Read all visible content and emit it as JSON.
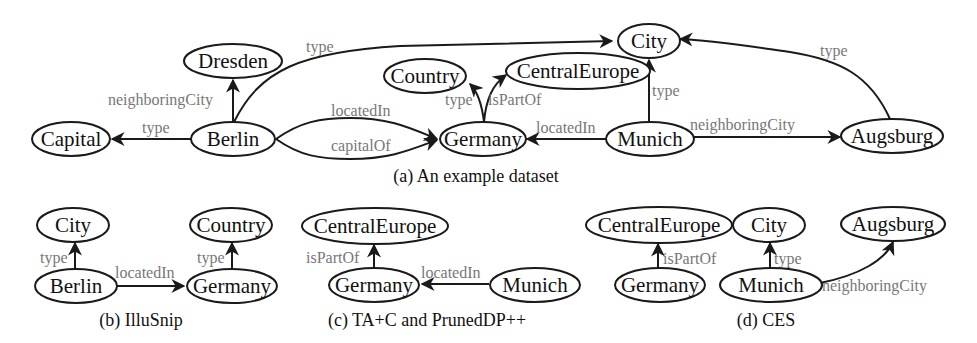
{
  "figure": {
    "panels": [
      {
        "id": "a",
        "caption": "(a) An example dataset",
        "nodes": [
          {
            "id": "Dresden",
            "label": "Dresden"
          },
          {
            "id": "Capital",
            "label": "Capital"
          },
          {
            "id": "Berlin",
            "label": "Berlin"
          },
          {
            "id": "Country",
            "label": "Country"
          },
          {
            "id": "CentralEurope",
            "label": "CentralEurope"
          },
          {
            "id": "City",
            "label": "City"
          },
          {
            "id": "Germany",
            "label": "Germany"
          },
          {
            "id": "Munich",
            "label": "Munich"
          },
          {
            "id": "Augsburg",
            "label": "Augsburg"
          }
        ],
        "edges": [
          {
            "from": "Berlin",
            "to": "Dresden",
            "label": "neighboringCity"
          },
          {
            "from": "Berlin",
            "to": "City",
            "label": "type"
          },
          {
            "from": "Berlin",
            "to": "Capital",
            "label": "type"
          },
          {
            "from": "Berlin",
            "to": "Germany",
            "label": "locatedIn"
          },
          {
            "from": "Berlin",
            "to": "Germany",
            "label": "capitalOf"
          },
          {
            "from": "Germany",
            "to": "Country",
            "label": "type"
          },
          {
            "from": "Germany",
            "to": "CentralEurope",
            "label": "isPartOf"
          },
          {
            "from": "Munich",
            "to": "City",
            "label": "type"
          },
          {
            "from": "Munich",
            "to": "Germany",
            "label": "locatedIn"
          },
          {
            "from": "Munich",
            "to": "Augsburg",
            "label": "neighboringCity"
          },
          {
            "from": "Augsburg",
            "to": "City",
            "label": "type"
          }
        ]
      },
      {
        "id": "b",
        "caption": "(b) IlluSnip",
        "nodes": [
          {
            "id": "City",
            "label": "City"
          },
          {
            "id": "Berlin",
            "label": "Berlin"
          },
          {
            "id": "Country",
            "label": "Country"
          },
          {
            "id": "Germany",
            "label": "Germany"
          }
        ],
        "edges": [
          {
            "from": "Berlin",
            "to": "City",
            "label": "type"
          },
          {
            "from": "Berlin",
            "to": "Germany",
            "label": "locatedIn"
          },
          {
            "from": "Germany",
            "to": "Country",
            "label": "type"
          }
        ]
      },
      {
        "id": "c",
        "caption": "(c) TA+C and PrunedDP++",
        "nodes": [
          {
            "id": "CentralEurope",
            "label": "CentralEurope"
          },
          {
            "id": "Germany",
            "label": "Germany"
          },
          {
            "id": "Munich",
            "label": "Munich"
          }
        ],
        "edges": [
          {
            "from": "Germany",
            "to": "CentralEurope",
            "label": "isPartOf"
          },
          {
            "from": "Munich",
            "to": "Germany",
            "label": "locatedIn"
          }
        ]
      },
      {
        "id": "d",
        "caption": "(d) CES",
        "nodes": [
          {
            "id": "CentralEurope",
            "label": "CentralEurope"
          },
          {
            "id": "City",
            "label": "City"
          },
          {
            "id": "Augsburg",
            "label": "Augsburg"
          },
          {
            "id": "Germany",
            "label": "Germany"
          },
          {
            "id": "Munich",
            "label": "Munich"
          }
        ],
        "edges": [
          {
            "from": "Germany",
            "to": "CentralEurope",
            "label": "isPartOf"
          },
          {
            "from": "Munich",
            "to": "City",
            "label": "type"
          },
          {
            "from": "Munich",
            "to": "Augsburg",
            "label": "neighboringCity"
          }
        ]
      }
    ]
  },
  "colors": {
    "stroke": "#1a1a1a",
    "node_text": "#111111",
    "edge_label": "#777777",
    "background": "#ffffff"
  }
}
